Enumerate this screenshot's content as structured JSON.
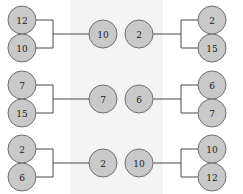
{
  "figure": {
    "type": "diagram",
    "background_color": "#ffffff",
    "band_color": "#f4f4f4",
    "node_fill": "#c9c9c9",
    "node_stroke": "#6f6f6f",
    "connector_color": "#4a4a4a",
    "band": {
      "x": 70,
      "width": 93
    },
    "node_radius": 14
  },
  "groups": [
    {
      "name": "top-left-merge",
      "orientation": "merge",
      "inputs": [
        {
          "label": "12",
          "cx": 22,
          "cy": 20
        },
        {
          "label": "10",
          "cx": 22,
          "cy": 48
        }
      ],
      "outputs": [
        {
          "label": "10",
          "cx": 103,
          "cy": 34
        }
      ],
      "bracket": {
        "x_stub": 36,
        "x_spine": 53,
        "x_stem_end": 89,
        "y_top": 20,
        "y_bottom": 48,
        "y_mid": 34
      }
    },
    {
      "name": "top-right-split",
      "orientation": "split",
      "inputs": [
        {
          "label": "2",
          "cx": 139,
          "cy": 34
        }
      ],
      "outputs": [
        {
          "label": "2",
          "cx": 212,
          "cy": 20
        },
        {
          "label": "15",
          "cx": 212,
          "cy": 48
        }
      ],
      "bracket": {
        "x_stub": 198,
        "x_spine": 181,
        "x_stem_end": 153,
        "y_top": 20,
        "y_bottom": 48,
        "y_mid": 34
      }
    },
    {
      "name": "middle-left-merge",
      "orientation": "merge",
      "inputs": [
        {
          "label": "7",
          "cx": 22,
          "cy": 85
        },
        {
          "label": "15",
          "cx": 22,
          "cy": 113
        }
      ],
      "outputs": [
        {
          "label": "7",
          "cx": 103,
          "cy": 99
        }
      ],
      "bracket": {
        "x_stub": 36,
        "x_spine": 53,
        "x_stem_end": 89,
        "y_top": 85,
        "y_bottom": 113,
        "y_mid": 99
      }
    },
    {
      "name": "middle-right-split",
      "orientation": "split",
      "inputs": [
        {
          "label": "6",
          "cx": 139,
          "cy": 99
        }
      ],
      "outputs": [
        {
          "label": "6",
          "cx": 212,
          "cy": 85
        },
        {
          "label": "7",
          "cx": 212,
          "cy": 113
        }
      ],
      "bracket": {
        "x_stub": 198,
        "x_spine": 181,
        "x_stem_end": 153,
        "y_top": 85,
        "y_bottom": 113,
        "y_mid": 99
      }
    },
    {
      "name": "bottom-left-merge",
      "orientation": "merge",
      "inputs": [
        {
          "label": "2",
          "cx": 22,
          "cy": 149
        },
        {
          "label": "6",
          "cx": 22,
          "cy": 177
        }
      ],
      "outputs": [
        {
          "label": "2",
          "cx": 103,
          "cy": 163
        }
      ],
      "bracket": {
        "x_stub": 36,
        "x_spine": 53,
        "x_stem_end": 89,
        "y_top": 149,
        "y_bottom": 177,
        "y_mid": 163
      }
    },
    {
      "name": "bottom-right-split",
      "orientation": "split",
      "inputs": [
        {
          "label": "10",
          "cx": 139,
          "cy": 163
        }
      ],
      "outputs": [
        {
          "label": "10",
          "cx": 212,
          "cy": 149
        },
        {
          "label": "12",
          "cx": 212,
          "cy": 177
        }
      ],
      "bracket": {
        "x_stub": 198,
        "x_spine": 181,
        "x_stem_end": 153,
        "y_top": 149,
        "y_bottom": 177,
        "y_mid": 163
      }
    }
  ]
}
